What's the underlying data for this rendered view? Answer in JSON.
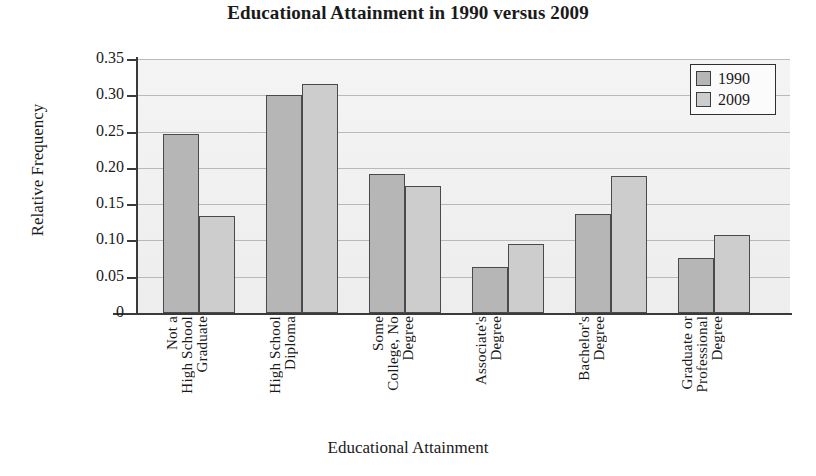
{
  "chart_data": {
    "type": "bar",
    "title": "Educational Attainment in 1990 versus 2009",
    "xlabel": "Educational Attainment",
    "ylabel": "Relative Frequency",
    "ylim": [
      0,
      0.35
    ],
    "grid": true,
    "legend_position": "top-right",
    "categories": [
      "Not a High School Graduate",
      "High School Diploma",
      "Some College, No Degree",
      "Associate's Degree",
      "Bachelor's Degree",
      "Graduate or Professional Degree"
    ],
    "category_lines": [
      [
        "Not a",
        "High School",
        "Graduate"
      ],
      [
        "High School",
        "Diploma"
      ],
      [
        "Some",
        "College, No",
        "Degree"
      ],
      [
        "Associate's",
        "Degree"
      ],
      [
        "Bachelor's",
        "Degree"
      ],
      [
        "Graduate or",
        "Professional",
        "Degree"
      ]
    ],
    "series": [
      {
        "name": "1990",
        "color": "#b6b6b6",
        "values": [
          0.247,
          0.301,
          0.192,
          0.063,
          0.136,
          0.076
        ]
      },
      {
        "name": "2009",
        "color": "#cdcdcd",
        "values": [
          0.133,
          0.316,
          0.175,
          0.095,
          0.189,
          0.107
        ]
      }
    ],
    "ytick_values": [
      0.35,
      0.3,
      0.25,
      0.2,
      0.15,
      0.1,
      0.05,
      0
    ],
    "ytick_labels": [
      "0.35",
      "0.30",
      "0.25",
      "0.20",
      "0.15",
      "0.10",
      "0.05",
      "0"
    ]
  },
  "legend": {
    "items": [
      {
        "label": "1990",
        "color": "#b6b6b6"
      },
      {
        "label": "2009",
        "color": "#cdcdcd"
      }
    ]
  }
}
